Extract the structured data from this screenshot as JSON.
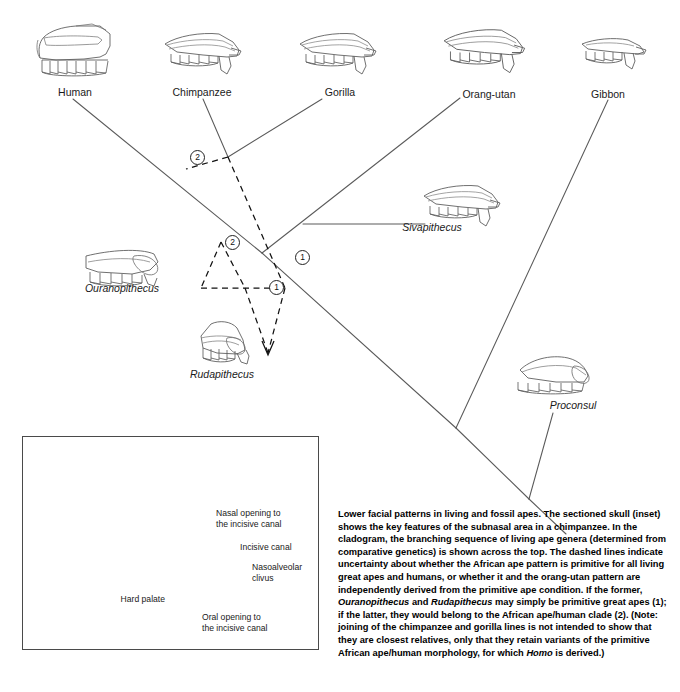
{
  "figure": {
    "type": "cladogram-with-anatomical-drawings",
    "title_text": "Lower facial patterns in living and fossil apes",
    "living_taxa": [
      {
        "label": "Human",
        "x": 75,
        "y": 88
      },
      {
        "label": "Chimpanzee",
        "x": 202,
        "y": 88
      },
      {
        "label": "Gorilla",
        "x": 340,
        "y": 88
      },
      {
        "label": "Orang-utan",
        "x": 489,
        "y": 90
      },
      {
        "label": "Gibbon",
        "x": 608,
        "y": 90
      }
    ],
    "fossil_taxa": [
      {
        "label": "Sivapithecus",
        "x": 432,
        "y": 223,
        "italic": true
      },
      {
        "label": "Ouranopithecus",
        "x": 85,
        "y": 284,
        "italic": true
      },
      {
        "label": "Rudapithecus",
        "x": 190,
        "y": 370,
        "italic": true
      },
      {
        "label": "Proconsul",
        "x": 547,
        "y": 400,
        "italic": true
      }
    ],
    "node_markers": [
      {
        "label": "2",
        "x": 196,
        "y": 155,
        "meaning": "African ape/human clade"
      },
      {
        "label": "2",
        "x": 231,
        "y": 240,
        "meaning": "African ape/human clade"
      },
      {
        "label": "1",
        "x": 301,
        "y": 256,
        "meaning": "primitive great apes"
      },
      {
        "label": "1",
        "x": 275,
        "y": 285,
        "meaning": "primitive great apes"
      }
    ],
    "inset": {
      "caption_note": "sectioned chimpanzee skull",
      "labels": [
        {
          "text_lines": [
            "Nasal opening to",
            "the incisive canal"
          ],
          "x": 216,
          "y": 514
        },
        {
          "text_lines": [
            "Incisive canal"
          ],
          "x": 240,
          "y": 546
        },
        {
          "text_lines": [
            "Nasoalveolar",
            "clivus"
          ],
          "x": 254,
          "y": 566
        },
        {
          "text_lines": [
            "Hard palate"
          ],
          "x": 139,
          "y": 598
        },
        {
          "text_lines": [
            "Oral opening to",
            "the incisive canal"
          ],
          "x": 216,
          "y": 618
        }
      ]
    },
    "caption": {
      "segments": [
        {
          "t": "Lower facial patterns in living and fossil apes. The sectioned skull (inset) shows the key features of the subnasal area in a chimpanzee. In the cladogram, the branching sequence of living ape genera (determined from comparative genetics) is shown across the top. The dashed lines indicate uncertainty about whether the African ape pattern is primitive for all living great apes and humans, or whether it and the orang-utan pattern are independently derived from the primitive ape condition. If the former, ",
          "i": false
        },
        {
          "t": "Ouranopithecus",
          "i": true
        },
        {
          "t": " and ",
          "i": false
        },
        {
          "t": "Rudapithecus",
          "i": true
        },
        {
          "t": " may simply be primitive great apes (1); if the latter, they would belong to the African ape/human clade (2). (Note: joining of the chimpanzee and gorilla lines is not intended to show that they are closest relatives, only that they retain variants of the primitive African ape/human morphology, for which ",
          "i": false
        },
        {
          "t": "Homo",
          "i": true
        },
        {
          "t": " is derived.)",
          "i": false
        }
      ]
    },
    "colors": {
      "line": "#5a5a5a",
      "dashed": "#111111",
      "text": "#1a1a1a",
      "background": "#ffffff"
    }
  }
}
